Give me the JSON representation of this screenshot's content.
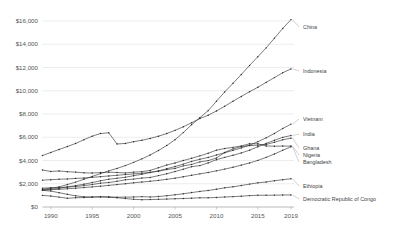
{
  "chart_data": {
    "type": "line",
    "title": "",
    "xlabel": "",
    "ylabel": "",
    "xlim": [
      1989,
      2019
    ],
    "ylim": [
      0,
      16000
    ],
    "grid": true,
    "legend_position": "right-inline-labels",
    "value_prefix": "$",
    "x": [
      1989,
      1990,
      1991,
      1992,
      1993,
      1994,
      1995,
      1996,
      1997,
      1998,
      1999,
      2000,
      2001,
      2002,
      2003,
      2004,
      2005,
      2006,
      2007,
      2008,
      2009,
      2010,
      2011,
      2012,
      2013,
      2014,
      2015,
      2016,
      2017,
      2018,
      2019
    ],
    "ytick_labels": [
      "$0",
      "$2,000",
      "$4,000",
      "$6,000",
      "$8,000",
      "$10,000",
      "$12,000",
      "$14,000",
      "$16,000"
    ],
    "ytick_values": [
      0,
      2000,
      4000,
      6000,
      8000,
      10000,
      12000,
      14000,
      16000
    ],
    "xtick_labels": [
      "1990",
      "1995",
      "2000",
      "2005",
      "2010",
      "2015",
      "2019"
    ],
    "xtick_values": [
      1990,
      1995,
      2000,
      2005,
      2010,
      2015,
      2019
    ],
    "series": [
      {
        "name": "China",
        "label": "China",
        "values": [
          1530,
          1610,
          1730,
          1930,
          2140,
          2390,
          2630,
          2870,
          3110,
          3320,
          3560,
          3840,
          4140,
          4480,
          4860,
          5290,
          5790,
          6400,
          7080,
          7680,
          8290,
          9090,
          9900,
          10640,
          11400,
          12180,
          12930,
          13690,
          14520,
          15360,
          16120
        ]
      },
      {
        "name": "Indonesia",
        "label": "Indonesia",
        "values": [
          4430,
          4690,
          4950,
          5200,
          5470,
          5790,
          6090,
          6320,
          6380,
          5420,
          5470,
          5620,
          5740,
          5900,
          6090,
          6320,
          6590,
          6900,
          7250,
          7610,
          7890,
          8260,
          8670,
          9100,
          9510,
          9920,
          10300,
          10720,
          11130,
          11550,
          11880
        ]
      },
      {
        "name": "Vietnam",
        "label": "Vietnam",
        "values": [
          1470,
          1530,
          1610,
          1730,
          1840,
          1960,
          2100,
          2250,
          2390,
          2470,
          2560,
          2690,
          2820,
          2960,
          3110,
          3290,
          3480,
          3690,
          3920,
          4110,
          4260,
          4470,
          4670,
          4870,
          5080,
          5320,
          5620,
          5950,
          6330,
          6750,
          7130
        ]
      },
      {
        "name": "India",
        "label": "India",
        "values": [
          1620,
          1660,
          1660,
          1710,
          1760,
          1840,
          1930,
          2050,
          2110,
          2210,
          2340,
          2400,
          2490,
          2540,
          2700,
          2860,
          3050,
          3250,
          3470,
          3560,
          3790,
          4070,
          4270,
          4450,
          4650,
          4890,
          5180,
          5470,
          5740,
          5990,
          6150
        ]
      },
      {
        "name": "Ghana",
        "label": "Ghana",
        "values": [
          2310,
          2350,
          2390,
          2410,
          2460,
          2490,
          2550,
          2610,
          2670,
          2730,
          2790,
          2850,
          2900,
          2990,
          3080,
          3220,
          3320,
          3540,
          3660,
          3880,
          3990,
          4210,
          4700,
          5000,
          5200,
          5280,
          5320,
          5380,
          5570,
          5780,
          5920
        ]
      },
      {
        "name": "Nigeria",
        "label": "Nigeria",
        "values": [
          3180,
          3060,
          3100,
          3040,
          3000,
          2940,
          2920,
          2960,
          2990,
          2970,
          2930,
          3000,
          3040,
          3150,
          3380,
          3610,
          3790,
          4000,
          4190,
          4400,
          4620,
          4890,
          5030,
          5130,
          5250,
          5440,
          5440,
          5250,
          5230,
          5240,
          5240
        ]
      },
      {
        "name": "Bangladesh",
        "label": "Bangladesh",
        "values": [
          1440,
          1490,
          1520,
          1570,
          1620,
          1670,
          1730,
          1790,
          1860,
          1930,
          2000,
          2080,
          2150,
          2210,
          2290,
          2380,
          2480,
          2600,
          2730,
          2850,
          2970,
          3110,
          3260,
          3420,
          3600,
          3790,
          4010,
          4270,
          4560,
          4880,
          5180
        ]
      },
      {
        "name": "Ethiopia",
        "label": "Ethiopia",
        "values": [
          1000,
          940,
          850,
          750,
          800,
          810,
          840,
          890,
          880,
          840,
          850,
          860,
          890,
          860,
          900,
          970,
          1050,
          1140,
          1240,
          1340,
          1420,
          1530,
          1650,
          1740,
          1850,
          1970,
          2080,
          2150,
          2260,
          2350,
          2430
        ]
      },
      {
        "name": "Democratic Republic of Congo",
        "label": "Democratic Republic of Congo",
        "values": [
          1430,
          1370,
          1230,
          1090,
          960,
          880,
          870,
          860,
          830,
          800,
          730,
          660,
          630,
          640,
          660,
          680,
          710,
          730,
          760,
          790,
          790,
          820,
          860,
          890,
          930,
          980,
          1010,
          1010,
          1020,
          1030,
          1040
        ]
      }
    ]
  }
}
